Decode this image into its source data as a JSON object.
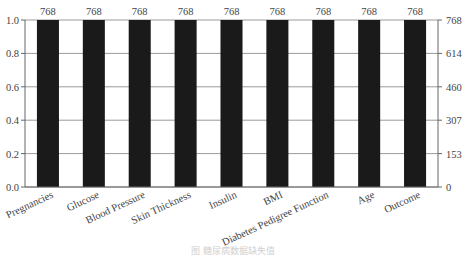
{
  "chart_data": {
    "type": "bar",
    "title": "",
    "categories": [
      "Pregnancies",
      "Glucose",
      "Blood Pressure",
      "Skin Thickness",
      "Insulin",
      "BMI",
      "Diabetes Pedigree Function",
      "Age",
      "Outcome"
    ],
    "values": [
      1.0,
      1.0,
      1.0,
      1.0,
      1.0,
      1.0,
      1.0,
      1.0,
      1.0
    ],
    "counts": [
      768,
      768,
      768,
      768,
      768,
      768,
      768,
      768,
      768
    ],
    "bar_labels": [
      "768",
      "768",
      "768",
      "768",
      "768",
      "768",
      "768",
      "768",
      "768"
    ],
    "xlabel": "",
    "ylabel": "",
    "ylim": [
      0,
      1.0
    ],
    "left_yticks": [
      "0.0",
      "0.2",
      "0.4",
      "0.6",
      "0.8",
      "1.0"
    ],
    "right_yticks": [
      "0",
      "153",
      "307",
      "460",
      "614",
      "768"
    ],
    "grid": true,
    "bar_color": "#1a1a1a",
    "legend": null
  },
  "caption": "图 糖尿病数据缺失值"
}
